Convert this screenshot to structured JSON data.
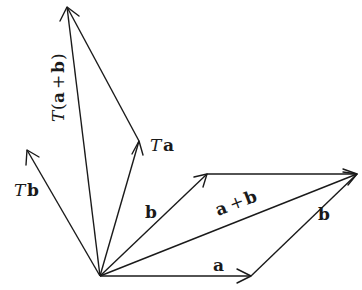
{
  "diagram": {
    "origin": [
      100,
      276
    ],
    "vectors": [
      {
        "id": "a",
        "label": "a",
        "from": [
          100,
          276
        ],
        "to": [
          251,
          276
        ]
      },
      {
        "id": "b",
        "label": "b",
        "from": [
          100,
          276
        ],
        "to": [
          207,
          174
        ]
      },
      {
        "id": "b_shift",
        "label": "b",
        "from": [
          251,
          276
        ],
        "to": [
          357,
          174
        ]
      },
      {
        "id": "a_shift",
        "label": "",
        "from": [
          207,
          174
        ],
        "to": [
          357,
          174
        ]
      },
      {
        "id": "a_plus_b",
        "label": "a + b",
        "from": [
          100,
          276
        ],
        "to": [
          357,
          174
        ]
      },
      {
        "id": "Ta",
        "label": "Ta",
        "from": [
          100,
          276
        ],
        "to": [
          139,
          141
        ]
      },
      {
        "id": "Tb",
        "label": "Tb",
        "from": [
          100,
          276
        ],
        "to": [
          27,
          150
        ]
      },
      {
        "id": "Tb_shift",
        "label": "",
        "from": [
          139,
          141
        ],
        "to": [
          67,
          7
        ]
      },
      {
        "id": "T_a_plus_b",
        "label": "T(a + b)",
        "from": [
          100,
          276
        ],
        "to": [
          67,
          7
        ]
      }
    ],
    "labels": {
      "a": "a",
      "b": "b",
      "b_shift": "b",
      "a_plus_b_a": "a",
      "a_plus_b_plus": "+",
      "a_plus_b_b": "b",
      "Ta_T": "T",
      "Ta_a": "a",
      "Tb_T": "T",
      "Tb_b": "b",
      "Tab_T": "T",
      "Tab_open": "(",
      "Tab_a": "a",
      "Tab_plus": "+",
      "Tab_b": "b",
      "Tab_close": ")"
    }
  }
}
